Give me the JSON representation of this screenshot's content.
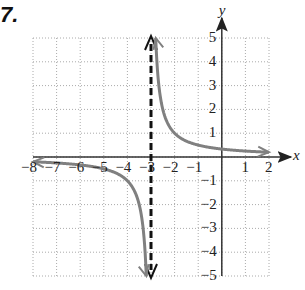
{
  "problem_number": "7.",
  "chart_data": {
    "type": "line",
    "title": "",
    "xlabel": "x",
    "ylabel": "y",
    "xlim": [
      -8,
      2
    ],
    "ylim": [
      -5,
      5
    ],
    "grid": true,
    "x_ticks": [
      -8,
      -7,
      -6,
      -5,
      -4,
      -3,
      -2,
      -1,
      1,
      2
    ],
    "y_ticks": [
      -5,
      -4,
      -3,
      -2,
      -1,
      1,
      2,
      3,
      4,
      5
    ],
    "function": "f(x) = 1/(x+3)",
    "vertical_asymptote": -3,
    "horizontal_asymptote": 0,
    "series": [
      {
        "name": "left branch",
        "x": [
          -8,
          -7,
          -6,
          -5,
          -4,
          -3.5,
          -3.2
        ],
        "y": [
          -0.2,
          -0.25,
          -0.33,
          -0.5,
          -1,
          -2,
          -5
        ]
      },
      {
        "name": "right branch",
        "x": [
          -2.8,
          -2.5,
          -2,
          -1,
          0,
          1,
          2
        ],
        "y": [
          5,
          2,
          1,
          0.5,
          0.33,
          0.25,
          0.2
        ]
      }
    ],
    "curve_color": "#808080",
    "asymptote_style": "dashed black"
  },
  "labels": {
    "x_axis": "x",
    "y_axis": "y",
    "x_ticks": [
      "−8",
      "−7",
      "−6",
      "−5",
      "−4",
      "−3",
      "−2",
      "−1",
      "1",
      "2"
    ],
    "y_ticks": [
      "5",
      "4",
      "3",
      "2",
      "1",
      "−1",
      "−2",
      "−3",
      "−4",
      "−5"
    ]
  }
}
